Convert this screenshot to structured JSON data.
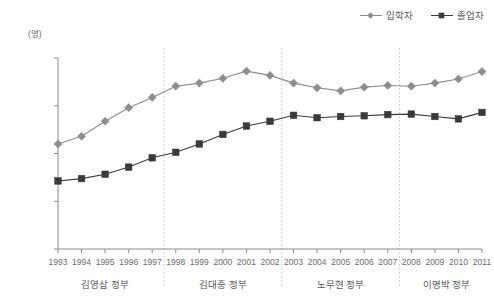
{
  "legend": {
    "position": "top-right",
    "items": [
      {
        "label": "입학자",
        "marker": "diamond",
        "color": "#8d8d8d"
      },
      {
        "label": "졸업자",
        "marker": "square",
        "color": "#3a3a3a"
      }
    ]
  },
  "axis": {
    "unit_label": "(명)",
    "y_ticks": [
      "900,000",
      "700,000",
      "500,000",
      "300,000",
      "100,000"
    ],
    "y_tick_values": [
      900000,
      700000,
      500000,
      300000,
      100000
    ]
  },
  "periods": [
    {
      "label": "김영삼 정부",
      "start_year": 1993,
      "end_year": 1997
    },
    {
      "label": "김대중 정부",
      "start_year": 1998,
      "end_year": 2002
    },
    {
      "label": "노무현 정부",
      "start_year": 2003,
      "end_year": 2007
    },
    {
      "label": "이명박 정부",
      "start_year": 2008,
      "end_year": 2011
    }
  ],
  "chart_data": {
    "type": "line",
    "title": "",
    "subtitle": "",
    "xlabel": "",
    "ylabel": "(명)",
    "ylim": [
      100000,
      900000
    ],
    "grid": false,
    "legend_position": "top-right",
    "categories": [
      "1993",
      "1994",
      "1995",
      "1996",
      "1997",
      "1998",
      "1999",
      "2000",
      "2001",
      "2002",
      "2003",
      "2004",
      "2005",
      "2006",
      "2007",
      "2008",
      "2009",
      "2010",
      "2011"
    ],
    "series": [
      {
        "name": "입학자",
        "marker": "diamond",
        "color": "#8d8d8d",
        "values": [
          540000,
          572000,
          635000,
          692000,
          735000,
          782000,
          795000,
          815000,
          845000,
          827000,
          795000,
          775000,
          762000,
          778000,
          785000,
          782000,
          795000,
          812000,
          843000
        ]
      },
      {
        "name": "졸업자",
        "marker": "square",
        "color": "#3a3a3a",
        "values": [
          385000,
          395000,
          413000,
          443000,
          482000,
          505000,
          540000,
          580000,
          615000,
          635000,
          660000,
          650000,
          655000,
          658000,
          663000,
          665000,
          655000,
          645000,
          672000
        ]
      }
    ],
    "annotations": [
      {
        "type": "vline",
        "after_category": "1997",
        "style": "dotted"
      },
      {
        "type": "vline",
        "after_category": "2002",
        "style": "dotted"
      },
      {
        "type": "vline",
        "after_category": "2007",
        "style": "dotted"
      }
    ]
  }
}
